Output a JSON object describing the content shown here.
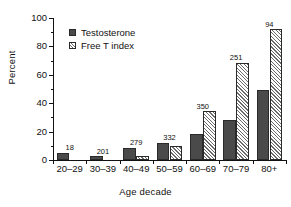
{
  "chart_data": {
    "type": "bar",
    "title": "",
    "xlabel": "Age decade",
    "ylabel": "Percent",
    "categories": [
      "20–29",
      "30–39",
      "40–49",
      "50–59",
      "60–69",
      "70–79",
      "80+"
    ],
    "series": [
      {
        "name": "Testosterone",
        "style": "solid-dark",
        "color": "#4a4a4a",
        "values": [
          5,
          2.5,
          8.5,
          12,
          18.5,
          28,
          49
        ]
      },
      {
        "name": "Free T index",
        "style": "hatched-white",
        "color": "#ffffff",
        "values": [
          0,
          0,
          2.5,
          10,
          34.5,
          68.5,
          92
        ]
      }
    ],
    "group_annotations": [
      "18",
      "201",
      "279",
      "332",
      "350",
      "251",
      "94"
    ],
    "ylim": [
      0,
      100
    ],
    "yticks": [
      0,
      20,
      40,
      60,
      80,
      100
    ],
    "ytick_labels": [
      "0",
      "20",
      "40",
      "60",
      "80",
      "100"
    ],
    "yminor_ticks": [
      10,
      30,
      50,
      70,
      90
    ],
    "grid": false,
    "legend_position": "top-left-inside"
  },
  "legend": {
    "entries": [
      {
        "label": "Testosterone"
      },
      {
        "label": "Free T index"
      }
    ]
  }
}
